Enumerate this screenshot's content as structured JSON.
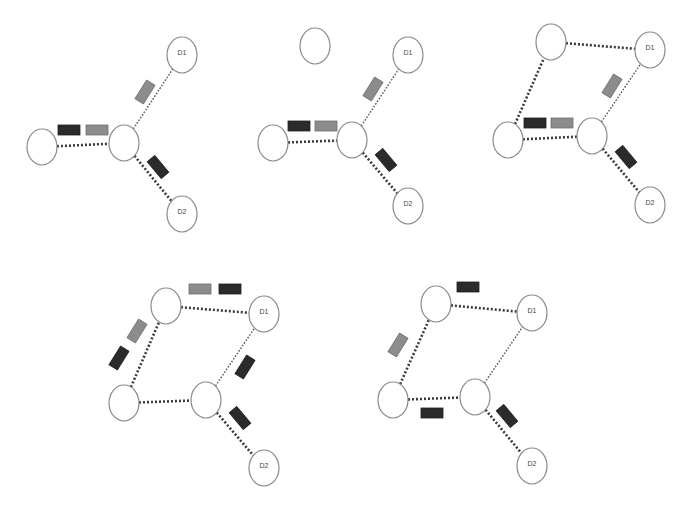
{
  "figure": {
    "title": "",
    "width": 688,
    "height": 509,
    "colors": {
      "background": "#ffffff",
      "node_stroke": "#8a8a8a",
      "edge_dark": "#3a3a3a",
      "packet_dark": "#2b2b2b",
      "packet_gray": "#8c8c8c"
    },
    "node_rx": 15,
    "node_ry": 18,
    "panels": [
      {
        "id": "panel-1",
        "nodes": [
          {
            "id": "A",
            "x": 42,
            "y": 147,
            "label": ""
          },
          {
            "id": "B",
            "x": 124,
            "y": 143,
            "label": ""
          },
          {
            "id": "D1",
            "x": 182,
            "y": 55,
            "label": "D1"
          },
          {
            "id": "D2",
            "x": 182,
            "y": 214,
            "label": "D2"
          }
        ],
        "edges": [
          {
            "from": "A",
            "to": "B",
            "style": "heavy"
          },
          {
            "from": "B",
            "to": "D1",
            "style": "light"
          },
          {
            "from": "B",
            "to": "D2",
            "style": "heavy"
          }
        ],
        "packets": [
          {
            "x": 69,
            "y": 130,
            "angle": 0,
            "shade": "dark"
          },
          {
            "x": 97,
            "y": 130,
            "angle": 0,
            "shade": "gray"
          },
          {
            "x": 145,
            "y": 92,
            "angle": -58,
            "shade": "gray"
          },
          {
            "x": 158,
            "y": 167,
            "angle": 50,
            "shade": "dark"
          }
        ]
      },
      {
        "id": "panel-2",
        "nodes": [
          {
            "id": "E",
            "x": 315,
            "y": 46,
            "label": ""
          },
          {
            "id": "A",
            "x": 273,
            "y": 143,
            "label": ""
          },
          {
            "id": "B",
            "x": 352,
            "y": 140,
            "label": ""
          },
          {
            "id": "D1",
            "x": 408,
            "y": 55,
            "label": "D1"
          },
          {
            "id": "D2",
            "x": 408,
            "y": 206,
            "label": "D2"
          }
        ],
        "edges": [
          {
            "from": "A",
            "to": "B",
            "style": "heavy"
          },
          {
            "from": "B",
            "to": "D1",
            "style": "light"
          },
          {
            "from": "B",
            "to": "D2",
            "style": "heavy"
          }
        ],
        "packets": [
          {
            "x": 299,
            "y": 126,
            "angle": 0,
            "shade": "dark"
          },
          {
            "x": 326,
            "y": 126,
            "angle": 0,
            "shade": "gray"
          },
          {
            "x": 373,
            "y": 89,
            "angle": -58,
            "shade": "gray"
          },
          {
            "x": 386,
            "y": 160,
            "angle": 50,
            "shade": "dark"
          }
        ]
      },
      {
        "id": "panel-3",
        "nodes": [
          {
            "id": "E",
            "x": 551,
            "y": 42,
            "label": ""
          },
          {
            "id": "A",
            "x": 508,
            "y": 140,
            "label": ""
          },
          {
            "id": "B",
            "x": 592,
            "y": 136,
            "label": ""
          },
          {
            "id": "D1",
            "x": 650,
            "y": 50,
            "label": "D1"
          },
          {
            "id": "D2",
            "x": 650,
            "y": 205,
            "label": "D2"
          }
        ],
        "edges": [
          {
            "from": "E",
            "to": "D1",
            "style": "heavy"
          },
          {
            "from": "A",
            "to": "E",
            "style": "heavy"
          },
          {
            "from": "A",
            "to": "B",
            "style": "heavy"
          },
          {
            "from": "B",
            "to": "D1",
            "style": "light"
          },
          {
            "from": "B",
            "to": "D2",
            "style": "heavy"
          }
        ],
        "packets": [
          {
            "x": 535,
            "y": 123,
            "angle": 0,
            "shade": "dark"
          },
          {
            "x": 562,
            "y": 123,
            "angle": 0,
            "shade": "gray"
          },
          {
            "x": 612,
            "y": 86,
            "angle": -58,
            "shade": "gray"
          },
          {
            "x": 626,
            "y": 157,
            "angle": 50,
            "shade": "dark"
          }
        ]
      },
      {
        "id": "panel-4",
        "nodes": [
          {
            "id": "E",
            "x": 166,
            "y": 306,
            "label": ""
          },
          {
            "id": "A",
            "x": 124,
            "y": 403,
            "label": ""
          },
          {
            "id": "B",
            "x": 206,
            "y": 400,
            "label": ""
          },
          {
            "id": "D1",
            "x": 264,
            "y": 314,
            "label": "D1"
          },
          {
            "id": "D2",
            "x": 264,
            "y": 468,
            "label": "D2"
          }
        ],
        "edges": [
          {
            "from": "E",
            "to": "D1",
            "style": "heavy"
          },
          {
            "from": "A",
            "to": "E",
            "style": "heavy"
          },
          {
            "from": "A",
            "to": "B",
            "style": "heavy"
          },
          {
            "from": "B",
            "to": "D1",
            "style": "light"
          },
          {
            "from": "B",
            "to": "D2",
            "style": "heavy"
          }
        ],
        "packets": [
          {
            "x": 200,
            "y": 289,
            "angle": 0,
            "shade": "gray"
          },
          {
            "x": 230,
            "y": 289,
            "angle": 0,
            "shade": "dark"
          },
          {
            "x": 137,
            "y": 331,
            "angle": -58,
            "shade": "gray"
          },
          {
            "x": 119,
            "y": 358,
            "angle": -58,
            "shade": "dark"
          },
          {
            "x": 245,
            "y": 367,
            "angle": -58,
            "shade": "dark"
          },
          {
            "x": 240,
            "y": 418,
            "angle": 50,
            "shade": "dark"
          }
        ]
      },
      {
        "id": "panel-5",
        "nodes": [
          {
            "id": "E",
            "x": 436,
            "y": 304,
            "label": ""
          },
          {
            "id": "A",
            "x": 393,
            "y": 400,
            "label": ""
          },
          {
            "id": "B",
            "x": 475,
            "y": 397,
            "label": ""
          },
          {
            "id": "D1",
            "x": 532,
            "y": 313,
            "label": "D1"
          },
          {
            "id": "D2",
            "x": 532,
            "y": 466,
            "label": "D2"
          }
        ],
        "edges": [
          {
            "from": "E",
            "to": "D1",
            "style": "heavy"
          },
          {
            "from": "A",
            "to": "E",
            "style": "heavy"
          },
          {
            "from": "A",
            "to": "B",
            "style": "heavy"
          },
          {
            "from": "B",
            "to": "D1",
            "style": "light"
          },
          {
            "from": "B",
            "to": "D2",
            "style": "heavy"
          }
        ],
        "packets": [
          {
            "x": 468,
            "y": 287,
            "angle": 0,
            "shade": "dark"
          },
          {
            "x": 398,
            "y": 345,
            "angle": -58,
            "shade": "gray"
          },
          {
            "x": 432,
            "y": 413,
            "angle": 0,
            "shade": "dark"
          },
          {
            "x": 507,
            "y": 416,
            "angle": 50,
            "shade": "dark"
          }
        ]
      }
    ]
  }
}
